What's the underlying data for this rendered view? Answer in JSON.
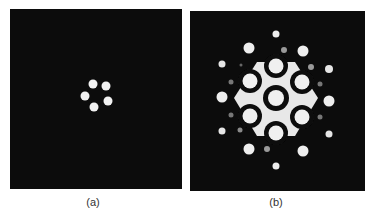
{
  "figure": {
    "panels": [
      {
        "id": "a",
        "label": "(a)",
        "box": {
          "x": 10,
          "y": 9,
          "w": 172,
          "h": 180
        },
        "label_pos": {
          "x": 93,
          "y": 196
        },
        "background": "#0c0c0c",
        "spots": [
          {
            "cx": 93,
            "cy": 84,
            "r": 4.5,
            "fill": "#f2f2f2"
          },
          {
            "cx": 106,
            "cy": 86,
            "r": 4.5,
            "fill": "#f2f2f2"
          },
          {
            "cx": 85,
            "cy": 96,
            "r": 4.5,
            "fill": "#f2f2f2"
          },
          {
            "cx": 108,
            "cy": 101,
            "r": 4.5,
            "fill": "#f2f2f2"
          },
          {
            "cx": 94,
            "cy": 107,
            "r": 4.5,
            "fill": "#f2f2f2"
          }
        ]
      },
      {
        "id": "b",
        "label": "(b)",
        "box": {
          "x": 190,
          "y": 11,
          "w": 175,
          "h": 180
        },
        "label_pos": {
          "x": 276,
          "y": 196
        },
        "background": "#0c0c0c",
        "hexagon_fill": "#e8e8e8",
        "hexagon_points": "257,62 295,62 318,98 295,136 257,136 234,98",
        "ringed_spots": [
          {
            "cx": 276,
            "cy": 98,
            "r": 8,
            "ring": 13
          },
          {
            "cx": 276,
            "cy": 66,
            "r": 7.5,
            "ring": 12
          },
          {
            "cx": 250,
            "cy": 81,
            "r": 7.5,
            "ring": 12
          },
          {
            "cx": 302,
            "cy": 82,
            "r": 7.5,
            "ring": 12
          },
          {
            "cx": 250,
            "cy": 116,
            "r": 7.5,
            "ring": 12
          },
          {
            "cx": 302,
            "cy": 117,
            "r": 7.5,
            "ring": 12
          },
          {
            "cx": 276,
            "cy": 133,
            "r": 7.5,
            "ring": 12
          }
        ],
        "spots": [
          {
            "cx": 276,
            "cy": 34,
            "r": 3.5,
            "fill": "#eeeeee"
          },
          {
            "cx": 249,
            "cy": 48,
            "r": 5.5,
            "fill": "#eeeeee"
          },
          {
            "cx": 303,
            "cy": 51,
            "r": 5.5,
            "fill": "#eeeeee"
          },
          {
            "cx": 222,
            "cy": 64,
            "r": 3.5,
            "fill": "#e6e6e6"
          },
          {
            "cx": 329,
            "cy": 69,
            "r": 4,
            "fill": "#e6e6e6"
          },
          {
            "cx": 222,
            "cy": 97,
            "r": 5.5,
            "fill": "#eeeeee"
          },
          {
            "cx": 329,
            "cy": 101,
            "r": 5.5,
            "fill": "#eeeeee"
          },
          {
            "cx": 222,
            "cy": 131,
            "r": 3.5,
            "fill": "#e6e6e6"
          },
          {
            "cx": 329,
            "cy": 134,
            "r": 3.5,
            "fill": "#e6e6e6"
          },
          {
            "cx": 249,
            "cy": 149,
            "r": 5.5,
            "fill": "#eeeeee"
          },
          {
            "cx": 303,
            "cy": 151,
            "r": 5.5,
            "fill": "#eeeeee"
          },
          {
            "cx": 276,
            "cy": 166,
            "r": 3.5,
            "fill": "#eeeeee"
          },
          {
            "cx": 284,
            "cy": 50,
            "r": 3,
            "fill": "#9a9a9a"
          },
          {
            "cx": 241,
            "cy": 65,
            "r": 1.5,
            "fill": "#666666"
          },
          {
            "cx": 311,
            "cy": 67,
            "r": 3,
            "fill": "#9a9a9a"
          },
          {
            "cx": 231,
            "cy": 82,
            "r": 2.5,
            "fill": "#777777"
          },
          {
            "cx": 320,
            "cy": 84,
            "r": 2.5,
            "fill": "#777777"
          },
          {
            "cx": 231,
            "cy": 115,
            "r": 2.5,
            "fill": "#777777"
          },
          {
            "cx": 320,
            "cy": 117,
            "r": 2.5,
            "fill": "#777777"
          },
          {
            "cx": 240,
            "cy": 130,
            "r": 2.5,
            "fill": "#8a8a8a"
          },
          {
            "cx": 267,
            "cy": 149,
            "r": 3,
            "fill": "#9a9a9a"
          }
        ]
      }
    ]
  }
}
